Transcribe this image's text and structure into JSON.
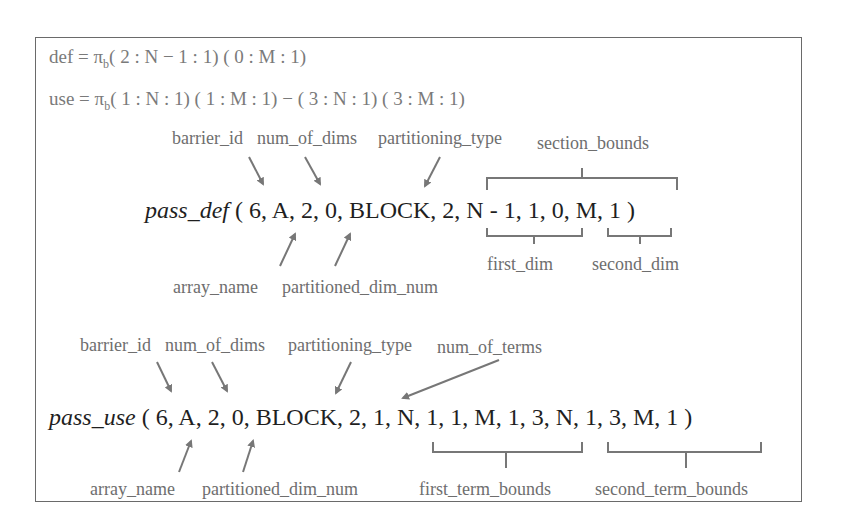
{
  "formulas": {
    "def": {
      "lhs": "def",
      "pi": "π",
      "sub": "b",
      "rhs": "( 2 : N − 1 : 1) ( 0 : M : 1)"
    },
    "use": {
      "lhs": "use",
      "pi": "π",
      "sub": "b",
      "rhs": "( 1 : N : 1) ( 1 : M : 1) − ( 3 : N : 1) ( 3 : M : 1)"
    }
  },
  "pass_def": {
    "func": "pass_def",
    "args": "( 6, A, 2, 0, BLOCK, 2, N - 1, 1, 0, M, 1  )",
    "labels_top": {
      "barrier_id": "barrier_id",
      "num_of_dims": "num_of_dims",
      "partitioning_type": "partitioning_type",
      "section_bounds": "section_bounds"
    },
    "labels_bottom": {
      "array_name": "array_name",
      "partitioned_dim_num": "partitioned_dim_num",
      "first_dim": "first_dim",
      "second_dim": "second_dim"
    }
  },
  "pass_use": {
    "func": "pass_use",
    "args": "( 6, A, 2, 0, BLOCK, 2, 1, N, 1, 1, M, 1, 3, N, 1, 3, M, 1 )",
    "labels_top": {
      "barrier_id": "barrier_id",
      "num_of_dims": "num_of_dims",
      "partitioning_type": "partitioning_type",
      "num_of_terms": "num_of_terms"
    },
    "labels_bottom": {
      "array_name": "array_name",
      "partitioned_dim_num": "partitioned_dim_num",
      "first_term_bounds": "first_term_bounds",
      "second_term_bounds": "second_term_bounds"
    }
  },
  "colors": {
    "arrow": "#777777",
    "frame": "#6a6a6a",
    "text": "#1f1f1f",
    "label": "#6e6e6e"
  }
}
